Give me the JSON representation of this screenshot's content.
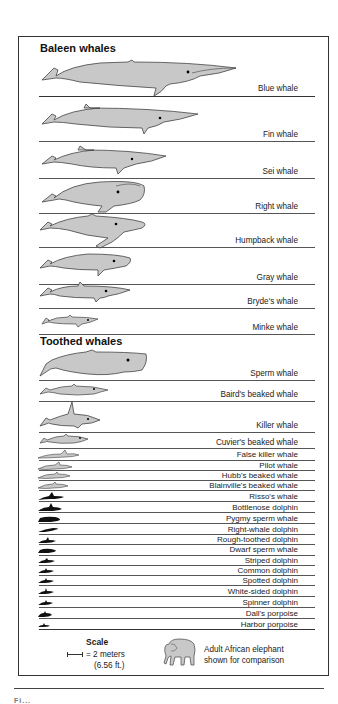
{
  "diagram": {
    "fill_color": "#c8c8c8",
    "dark_fill_color": "#111111",
    "outline_color": "#333333"
  },
  "sections": {
    "baleen": {
      "heading": "Baleen whales",
      "species": [
        {
          "name": "Blue whale"
        },
        {
          "name": "Fin whale"
        },
        {
          "name": "Sei whale"
        },
        {
          "name": "Right whale"
        },
        {
          "name": "Humpback whale"
        },
        {
          "name": "Gray whale"
        },
        {
          "name": "Bryde's whale"
        },
        {
          "name": "Minke whale"
        }
      ]
    },
    "toothed": {
      "heading": "Toothed whales",
      "species": [
        {
          "name": "Sperm whale"
        },
        {
          "name": "Baird's beaked whale"
        },
        {
          "name": "Killer whale"
        },
        {
          "name": "Cuvier's beaked whale"
        },
        {
          "name": "False killer whale"
        },
        {
          "name": "Pilot whale"
        },
        {
          "name": "Hubb's beaked whale"
        },
        {
          "name": "Blainville's beaked whale"
        },
        {
          "name": "Risso's whale"
        },
        {
          "name": "Bottlenose dolphin"
        },
        {
          "name": "Pygmy sperm whale"
        },
        {
          "name": "Right-whale dolphin"
        },
        {
          "name": "Rough-toothed dolphin"
        },
        {
          "name": "Dwarf sperm whale"
        },
        {
          "name": "Striped dolphin"
        },
        {
          "name": "Common dolphin"
        },
        {
          "name": "Spotted dolphin"
        },
        {
          "name": "White-sided dolphin"
        },
        {
          "name": "Spinner dolphin"
        },
        {
          "name": "Dall's porpoise"
        },
        {
          "name": "Harbor porpoise"
        }
      ]
    }
  },
  "legend": {
    "scale_title": "Scale",
    "scale_value": "= 2 meters",
    "scale_feet": "(6.56 ft.)",
    "elephant_line1": "Adult African elephant",
    "elephant_line2": "shown for comparison"
  },
  "caption": {
    "partial_text": "Fi..."
  }
}
